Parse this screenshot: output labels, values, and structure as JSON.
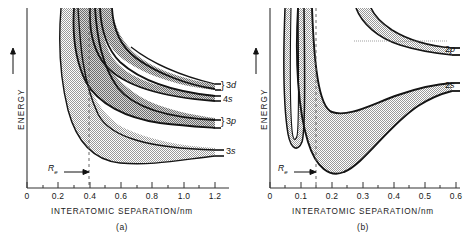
{
  "figure": {
    "background_color": "#ffffff",
    "line_color": "#111111",
    "band_fill_color": "#c9c9c9",
    "band_fill_dark_color": "#a8a8a8",
    "axis_color": "#333333"
  },
  "panels": [
    {
      "id": "a",
      "caption": "(a)",
      "y_axis": {
        "label": "ENERGY",
        "arrow": "up-arrow-icon",
        "ticks": []
      },
      "x_axis": {
        "label": "INTERATOMIC SEPARATION/nm",
        "min": 0,
        "max": 1.3,
        "major_ticks": [
          0,
          0.2,
          0.4,
          0.6,
          0.8,
          1.0,
          1.2
        ],
        "major_tick_labels": [
          "0",
          "0.2",
          "0.4",
          "0.6",
          "0.8",
          "1.0",
          "1.2"
        ],
        "minor_tick_step": 0.1,
        "unit": "nm"
      },
      "equilibrium_marker": {
        "label": "R",
        "subscript": "e",
        "value": 0.37,
        "line_style": "dashed"
      },
      "band_labels": [
        {
          "text": "3d",
          "brace": "}",
          "level": 1
        },
        {
          "text": "4s",
          "brace": "",
          "level": 2
        },
        {
          "text": "3p",
          "brace": "}",
          "level": 3
        },
        {
          "text": "3s",
          "brace": "",
          "level": 4
        }
      ]
    },
    {
      "id": "b",
      "caption": "(b)",
      "y_axis": {
        "label": "ENERGY",
        "arrow": "up-arrow-icon",
        "ticks": []
      },
      "x_axis": {
        "label": "INTERATOMIC SEPARATION/nm",
        "min": 0,
        "max": 0.63,
        "major_ticks": [
          0,
          0.1,
          0.2,
          0.3,
          0.4,
          0.5,
          0.6
        ],
        "major_tick_labels": [
          "0",
          "0.1",
          "0.2",
          "0.3",
          "0.4",
          "0.5",
          "0.6"
        ],
        "minor_tick_step": 0.05,
        "unit": "nm"
      },
      "equilibrium_marker": {
        "label": "R",
        "subscript": "e",
        "value": 0.15,
        "line_style": "dashed"
      },
      "band_labels": [
        {
          "text": "2p",
          "brace": "",
          "level": 1
        },
        {
          "text": "2s",
          "brace": "",
          "level": 2
        }
      ]
    }
  ],
  "chart_data": {
    "type": "line",
    "xlabel": "INTERATOMIC SEPARATION/nm",
    "ylabel": "ENERGY",
    "subplots": [
      {
        "id": "a",
        "caption": "(a)",
        "xlim": [
          0,
          1.3
        ],
        "ylim_arbitrary": true,
        "xticks": [
          0,
          0.2,
          0.4,
          0.6,
          0.8,
          1.0,
          1.2
        ],
        "grid": false,
        "equilibrium_separation_nm": 0.37,
        "bands": [
          {
            "name": "3s",
            "asymptote_energy_arb": 0.27,
            "band_upper_x": [
              0.2,
              0.24,
              0.28,
              0.33,
              0.4,
              0.5,
              0.65,
              0.85,
              1.05,
              1.25
            ],
            "band_upper_y": [
              0.97,
              0.8,
              0.66,
              0.56,
              0.47,
              0.4,
              0.34,
              0.3,
              0.28,
              0.27
            ],
            "band_lower_x": [
              0.22,
              0.26,
              0.3,
              0.34,
              0.4,
              0.5,
              0.65,
              0.85,
              1.05,
              1.25
            ],
            "band_lower_y": [
              0.3,
              0.14,
              0.08,
              0.08,
              0.11,
              0.16,
              0.21,
              0.25,
              0.265,
              0.27
            ]
          },
          {
            "name": "3p",
            "asymptote_energy_arb": 0.57,
            "band_upper_x": [
              0.27,
              0.3,
              0.35,
              0.42,
              0.52,
              0.68,
              0.88,
              1.08,
              1.25
            ],
            "band_upper_y": [
              1.0,
              0.9,
              0.8,
              0.72,
              0.66,
              0.61,
              0.58,
              0.572,
              0.57
            ],
            "band_lower_x": [
              0.3,
              0.34,
              0.4,
              0.48,
              0.58,
              0.72,
              0.9,
              1.1,
              1.25
            ],
            "band_lower_y": [
              0.62,
              0.46,
              0.39,
              0.39,
              0.43,
              0.48,
              0.53,
              0.56,
              0.57
            ]
          },
          {
            "name": "4s",
            "asymptote_energy_arb": 0.66,
            "band_upper_x": [
              0.33,
              0.37,
              0.43,
              0.52,
              0.65,
              0.82,
              1.02,
              1.25
            ],
            "band_upper_y": [
              1.0,
              0.92,
              0.84,
              0.77,
              0.72,
              0.685,
              0.67,
              0.66
            ],
            "band_lower_x": [
              0.36,
              0.4,
              0.46,
              0.55,
              0.68,
              0.85,
              1.05,
              1.25
            ],
            "band_lower_y": [
              0.97,
              0.86,
              0.78,
              0.72,
              0.685,
              0.67,
              0.662,
              0.66
            ]
          },
          {
            "name": "3d",
            "asymptote_energy_arb": 0.73,
            "band_upper_x": [
              0.57,
              0.65,
              0.78,
              0.95,
              1.1,
              1.25
            ],
            "band_upper_y": [
              1.0,
              0.9,
              0.82,
              0.77,
              0.745,
              0.735
            ],
            "band_lower_x": [
              0.4,
              0.46,
              0.55,
              0.7,
              0.9,
              1.08,
              1.25
            ],
            "band_lower_y": [
              1.0,
              0.88,
              0.81,
              0.76,
              0.735,
              0.728,
              0.725
            ]
          }
        ]
      },
      {
        "id": "b",
        "caption": "(b)",
        "xlim": [
          0,
          0.63
        ],
        "ylim_arbitrary": true,
        "xticks": [
          0,
          0.1,
          0.2,
          0.3,
          0.4,
          0.5,
          0.6
        ],
        "grid": false,
        "equilibrium_separation_nm": 0.15,
        "bands": [
          {
            "name": "2s",
            "asymptote_energy_arb": 0.44,
            "band_upper_x": [
              0.095,
              0.115,
              0.14,
              0.18,
              0.24,
              0.32,
              0.42,
              0.52,
              0.6
            ],
            "band_upper_y": [
              1.0,
              0.82,
              0.7,
              0.61,
              0.54,
              0.49,
              0.455,
              0.445,
              0.44
            ],
            "band_lower_x": [
              0.125,
              0.14,
              0.155,
              0.18,
              0.24,
              0.33,
              0.44,
              0.54,
              0.6
            ],
            "band_lower_y": [
              0.42,
              0.17,
              0.1,
              0.12,
              0.22,
              0.32,
              0.39,
              0.425,
              0.44
            ]
          },
          {
            "name": "2p",
            "asymptote_energy_arb": 0.79,
            "band_upper_x": [
              0.055,
              0.07,
              0.09,
              0.11,
              0.13,
              0.15
            ],
            "band_upper_y": [
              1.0,
              0.6,
              0.3,
              0.22,
              0.3,
              0.62
            ],
            "band_lower_x": [
              0.27,
              0.31,
              0.37,
              0.45,
              0.53,
              0.6
            ],
            "band_lower_y": [
              1.0,
              0.92,
              0.86,
              0.82,
              0.8,
              0.79
            ]
          }
        ]
      }
    ]
  }
}
